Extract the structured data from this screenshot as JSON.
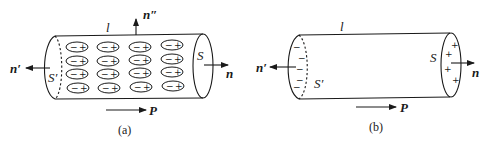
{
  "figures": [
    {
      "id": "a",
      "caption": "(a)",
      "labels": {
        "length": "l",
        "normal_top": "n″",
        "normal_left": "n′",
        "normal_right": "n",
        "surface_left": "S′",
        "surface_right": "S",
        "polarization": "P"
      },
      "dipole_grid": {
        "rows": 4,
        "cols": 4,
        "neg_sign": "−",
        "pos_sign": "+"
      }
    },
    {
      "id": "b",
      "caption": "(b)",
      "labels": {
        "length": "l",
        "normal_left": "n′",
        "normal_right": "n",
        "surface_left": "S′",
        "surface_right": "S",
        "polarization": "P"
      },
      "surface_charges": {
        "left_sign": "−",
        "left_count": 5,
        "right_sign": "+",
        "right_count": 4
      }
    }
  ],
  "colors": {
    "stroke": "#1a1a1a",
    "background": "#ffffff"
  }
}
